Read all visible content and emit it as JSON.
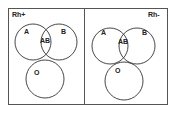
{
  "panels": [
    {
      "title": "Rh+",
      "circles": [
        {
          "label": "A"
        },
        {
          "label": "B"
        },
        {
          "label": "O"
        }
      ],
      "intersection_label": "AB"
    },
    {
      "title": "Rh-",
      "circles": [
        {
          "label": "A"
        },
        {
          "label": "B"
        },
        {
          "label": "O"
        }
      ],
      "intersection_label": "AB"
    }
  ],
  "colors": {
    "stroke": "#333333",
    "background": "#ffffff"
  }
}
